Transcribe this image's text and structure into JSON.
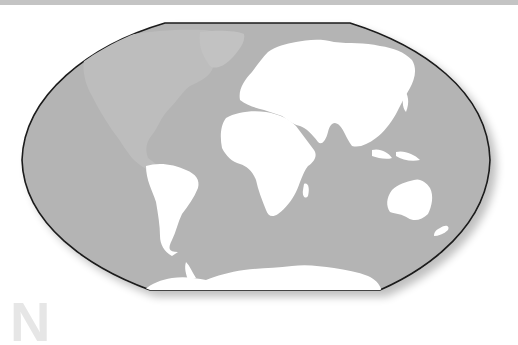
{
  "figure": {
    "type": "world-map",
    "projection": "winkel-tripel-style",
    "highlighted_region": "North America",
    "watermark_letter": "N"
  },
  "colors": {
    "background": "#ffffff",
    "top_strip": "#c4c4c4",
    "ocean": "#b4b4b4",
    "land": "#ffffff",
    "highlighted_land": "#bdbdbd",
    "outline": "#1a1a1a",
    "watermark": "#e6e6e6"
  },
  "regions": [
    {
      "name": "North America",
      "style": "highlighted"
    },
    {
      "name": "Greenland",
      "style": "highlighted"
    },
    {
      "name": "South America",
      "style": "land"
    },
    {
      "name": "Europe",
      "style": "land"
    },
    {
      "name": "Africa",
      "style": "land"
    },
    {
      "name": "Asia",
      "style": "land"
    },
    {
      "name": "Australia",
      "style": "land"
    },
    {
      "name": "Antarctica",
      "style": "land"
    }
  ]
}
